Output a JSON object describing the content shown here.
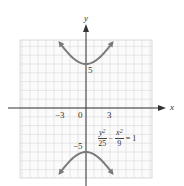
{
  "chart_data": {
    "type": "line",
    "title": "",
    "equation": "y^2/25 - x^2/9 = 1",
    "xlabel": "x",
    "ylabel": "y",
    "x_tick_labels": [
      "-3",
      "0",
      "3"
    ],
    "y_tick_labels": [
      "5",
      "-5"
    ],
    "xlim": [
      -7.5,
      7.5
    ],
    "ylim": [
      -8,
      7.5
    ],
    "grid": true,
    "series": [
      {
        "name": "upper branch",
        "x": [
          -3.2,
          -2.4,
          -1.6,
          -0.8,
          0,
          0.8,
          1.6,
          2.4,
          3.2
        ],
        "y": [
          7.3,
          6.4,
          5.67,
          5.17,
          5,
          5.17,
          5.67,
          6.4,
          7.3
        ]
      },
      {
        "name": "lower branch",
        "x": [
          -3.2,
          -2.4,
          -1.6,
          -0.8,
          0,
          0.8,
          1.6,
          2.4,
          3.2
        ],
        "y": [
          -7.3,
          -6.4,
          -5.67,
          -5.17,
          -5,
          -5.17,
          -5.67,
          -6.4,
          -7.3
        ]
      }
    ],
    "vertices": [
      [
        0,
        5
      ],
      [
        0,
        -5
      ]
    ],
    "colors": {
      "curve": "#7a7a7a",
      "grid": "#d9d9d9",
      "axis": "#333333"
    }
  },
  "labels": {
    "x_axis": "x",
    "y_axis": "y",
    "tick_neg3": "−3",
    "tick_0": "0",
    "tick_3": "3",
    "tick_5": "5",
    "tick_neg5": "−5",
    "eq_num1": "y",
    "eq_den1": "25",
    "eq_minus": "−",
    "eq_num2": "x",
    "eq_den2": "9",
    "eq_rhs": "= 1",
    "sq": "2"
  }
}
